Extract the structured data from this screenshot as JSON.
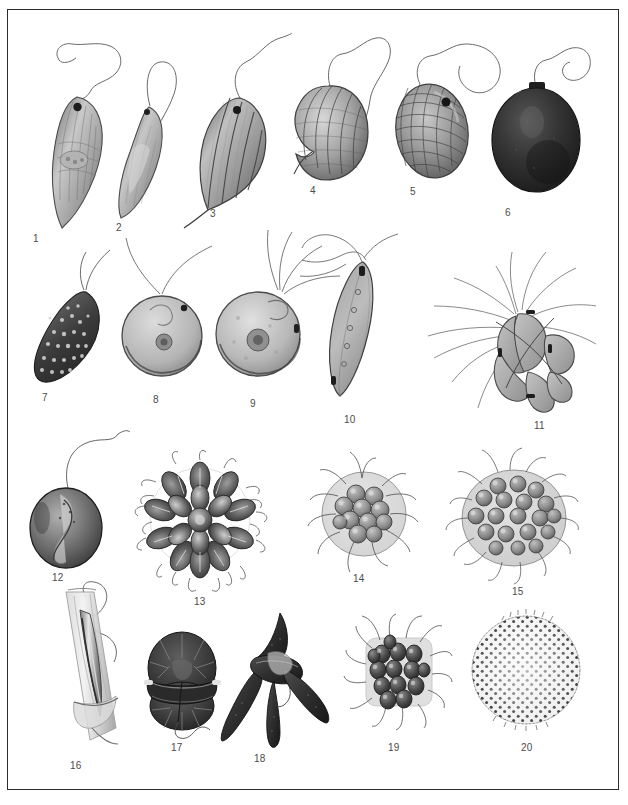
{
  "plate": {
    "kind": "scientific-illustration-plate",
    "subject": "flagellate protists and colonial algae",
    "background_color": "#ffffff",
    "frame_color": "#2b2b2b",
    "ink_color": "#3a3a3a",
    "label_color": "#4c4c4c",
    "rows": 4,
    "figure_count": 20
  },
  "figures": [
    {
      "number": "1",
      "label_x": 33,
      "label_y": 233,
      "x": 30,
      "y": 75,
      "w": 90,
      "h": 155,
      "kind": "euglenoid-spindle",
      "tone": "#9a9a9a"
    },
    {
      "number": "2",
      "label_x": 116,
      "label_y": 222,
      "x": 92,
      "y": 70,
      "w": 80,
      "h": 150,
      "kind": "crescent-flagellate",
      "tone": "#a5a5a5"
    },
    {
      "number": "3",
      "label_x": 210,
      "label_y": 208,
      "x": 172,
      "y": 62,
      "w": 95,
      "h": 150,
      "kind": "ribbed-teardrop",
      "tone": "#8f8f8f"
    },
    {
      "number": "4",
      "label_x": 310,
      "label_y": 185,
      "x": 278,
      "y": 60,
      "w": 90,
      "h": 130,
      "kind": "striate-ovoid",
      "tone": "#9c9c9c"
    },
    {
      "number": "5",
      "label_x": 410,
      "label_y": 186,
      "x": 380,
      "y": 58,
      "w": 95,
      "h": 130,
      "kind": "cross-hatched-ovoid",
      "tone": "#8a8a8a"
    },
    {
      "number": "6",
      "label_x": 505,
      "label_y": 207,
      "x": 482,
      "y": 62,
      "w": 95,
      "h": 140,
      "kind": "dark-ovoid",
      "tone": "#3d3d3d"
    },
    {
      "number": "7",
      "label_x": 42,
      "label_y": 392,
      "x": 22,
      "y": 252,
      "w": 90,
      "h": 135,
      "kind": "speckled-oval",
      "tone": "#4a4a4a"
    },
    {
      "number": "8",
      "label_x": 153,
      "label_y": 394,
      "x": 110,
      "y": 240,
      "w": 95,
      "h": 145,
      "kind": "round-biflagellate",
      "tone": "#b2b2b2"
    },
    {
      "number": "9",
      "label_x": 250,
      "label_y": 398,
      "x": 212,
      "y": 238,
      "w": 100,
      "h": 148,
      "kind": "round-quadriflagellate",
      "tone": "#b6b6b6"
    },
    {
      "number": "10",
      "label_x": 344,
      "label_y": 414,
      "x": 320,
      "y": 245,
      "w": 80,
      "h": 160,
      "kind": "fusiform-flagellate",
      "tone": "#9f9f9f"
    },
    {
      "number": "11",
      "label_x": 534,
      "label_y": 420,
      "x": 425,
      "y": 258,
      "w": 155,
      "h": 150,
      "kind": "bristled-cluster",
      "tone": "#a8a8a8"
    },
    {
      "number": "12",
      "label_x": 52,
      "label_y": 572,
      "x": 22,
      "y": 440,
      "w": 95,
      "h": 125,
      "kind": "dark-sphere-flagellate",
      "tone": "#5a5a5a"
    },
    {
      "number": "13",
      "label_x": 194,
      "label_y": 596,
      "x": 135,
      "y": 452,
      "w": 125,
      "h": 135,
      "kind": "rosette-colony",
      "tone": "#555555"
    },
    {
      "number": "14",
      "label_x": 353,
      "label_y": 573,
      "x": 310,
      "y": 462,
      "w": 105,
      "h": 105,
      "kind": "small-gloeo-colony",
      "tone": "#8c8c8c"
    },
    {
      "number": "15",
      "label_x": 512,
      "label_y": 586,
      "x": 450,
      "y": 460,
      "w": 120,
      "h": 120,
      "kind": "large-gloeo-colony",
      "tone": "#9a9a9a"
    },
    {
      "number": "16",
      "label_x": 70,
      "label_y": 760,
      "x": 50,
      "y": 585,
      "w": 80,
      "h": 165,
      "kind": "lorica-tube",
      "tone": "#9e9e9e"
    },
    {
      "number": "17",
      "label_x": 171,
      "label_y": 742,
      "x": 135,
      "y": 625,
      "w": 90,
      "h": 110,
      "kind": "armoured-dinoflagellate",
      "tone": "#3f3f3f"
    },
    {
      "number": "18",
      "label_x": 254,
      "label_y": 753,
      "x": 225,
      "y": 612,
      "w": 95,
      "h": 135,
      "kind": "horned-dinoflagellate",
      "tone": "#3a3a3a"
    },
    {
      "number": "19",
      "label_x": 388,
      "label_y": 742,
      "x": 345,
      "y": 620,
      "w": 105,
      "h": 110,
      "kind": "square-plate-colony",
      "tone": "#6a6a6a"
    },
    {
      "number": "20",
      "label_x": 521,
      "label_y": 742,
      "x": 470,
      "y": 612,
      "w": 115,
      "h": 120,
      "kind": "stippled-sphere",
      "tone": "#777777"
    }
  ]
}
